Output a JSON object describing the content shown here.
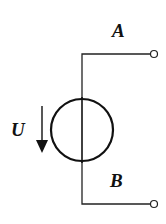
{
  "diagram": {
    "type": "circuit-symbol",
    "component": "ideal-voltage-source",
    "terminals": [
      {
        "id": "A",
        "label": "A",
        "position": "top"
      },
      {
        "id": "B",
        "label": "B",
        "position": "bottom"
      }
    ],
    "voltage": {
      "label": "U",
      "arrow_direction": "down"
    },
    "colors": {
      "stroke": "#111111",
      "background": "#ffffff"
    }
  }
}
